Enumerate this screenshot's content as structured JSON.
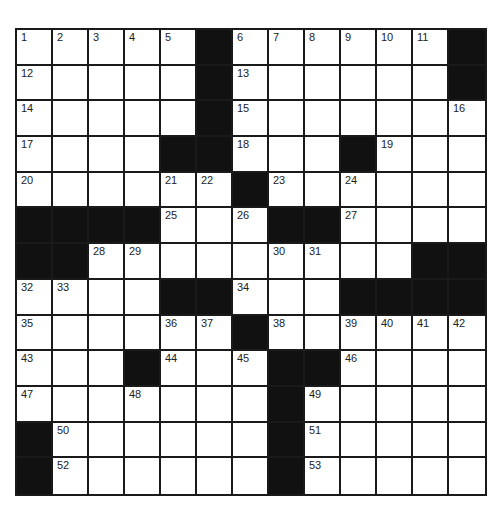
{
  "puzzle": {
    "rows": 13,
    "cols": 13,
    "colors": {
      "block": "#111111",
      "cell": "#ffffff",
      "grid_line": "#1a1a1a",
      "number": "#222222"
    },
    "grid": [
      [
        "1",
        "2",
        "3",
        "4",
        "5",
        "#",
        "6",
        "7",
        "8",
        "9",
        "10",
        "11",
        "#"
      ],
      [
        "12",
        ".",
        ".",
        ".",
        ".",
        "#",
        "13",
        ".",
        ".",
        ".",
        ".",
        ".",
        "#"
      ],
      [
        "14",
        ".",
        ".",
        ".",
        ".",
        "#",
        "15",
        ".",
        ".",
        ".",
        ".",
        ".",
        "16"
      ],
      [
        "17",
        ".",
        ".",
        ".",
        "#",
        "#",
        "18",
        ".",
        ".",
        "#",
        "19",
        ".",
        "."
      ],
      [
        "20",
        ".",
        ".",
        ".",
        "21",
        "22",
        "#",
        "23",
        ".",
        "24",
        ".",
        ".",
        "."
      ],
      [
        "#",
        "#",
        "#",
        "#",
        "25",
        ".",
        "26",
        "#",
        "#",
        "27",
        ".",
        ".",
        "."
      ],
      [
        "#",
        "#",
        "28",
        "29",
        ".",
        ".",
        ".",
        "30",
        "31",
        ".",
        ".",
        "#",
        "#"
      ],
      [
        "32",
        "33",
        ".",
        ".",
        "#",
        "#",
        "34",
        ".",
        ".",
        "#",
        "#",
        "#",
        "#"
      ],
      [
        "35",
        ".",
        ".",
        ".",
        "36",
        "37",
        "#",
        "38",
        ".",
        "39",
        "40",
        "41",
        "42"
      ],
      [
        "43",
        ".",
        ".",
        "#",
        "44",
        ".",
        "45",
        "#",
        "#",
        "46",
        ".",
        ".",
        "."
      ],
      [
        "47",
        ".",
        ".",
        "48",
        ".",
        ".",
        ".",
        "#",
        "49",
        ".",
        ".",
        ".",
        "."
      ],
      [
        "#",
        "50",
        ".",
        ".",
        ".",
        ".",
        ".",
        "#",
        "51",
        ".",
        ".",
        ".",
        "."
      ],
      [
        "#",
        "52",
        ".",
        ".",
        ".",
        ".",
        ".",
        "#",
        "53",
        ".",
        ".",
        ".",
        "."
      ]
    ]
  }
}
